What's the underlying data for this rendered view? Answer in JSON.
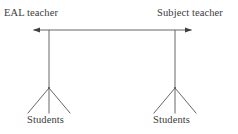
{
  "diagram": {
    "background_color": "#ffffff",
    "line_color": "#555555",
    "text_color": "#3b3b3b",
    "nodes": {
      "eal_teacher": "EAL teacher",
      "subject_teacher": "Subject teacher",
      "students_left": "Students",
      "students_right": "Students"
    },
    "connector": {
      "type": "double-headed-arrow",
      "from": "EAL teacher",
      "to": "Subject teacher"
    },
    "branches": {
      "left_count": 3,
      "right_count": 3
    }
  }
}
